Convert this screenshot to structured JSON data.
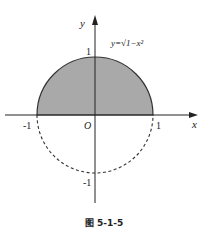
{
  "figure": {
    "caption": "图 5-1-5",
    "equation": "y=√1−x²",
    "axes": {
      "x_label": "x",
      "y_label": "y",
      "origin_label": "O",
      "x_ticks": [
        "-1",
        "1"
      ],
      "y_ticks": [
        "1",
        "-1"
      ]
    },
    "shapes": {
      "upper_semicircle": {
        "style": "solid",
        "fill": "#a9a9a9",
        "stroke": "#333333"
      },
      "lower_semicircle": {
        "style": "dashed",
        "stroke": "#333333"
      }
    }
  }
}
